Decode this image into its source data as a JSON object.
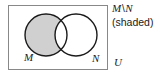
{
  "figure": {
    "kind": "venn-diagram",
    "width": 164,
    "height": 77,
    "background": "#ffffff"
  },
  "diagram": {
    "universe_box": {
      "label": "U",
      "x": 8,
      "y": 5,
      "width": 100,
      "height": 65,
      "stroke": "#888888",
      "stroke_width": 1,
      "fill": "#ffffff"
    },
    "circles": [
      {
        "name": "M",
        "label": "M",
        "cx": 46,
        "cy": 35,
        "r": 21,
        "stroke": "#1a1a1a",
        "stroke_width": 1.4,
        "label_x": 24,
        "label_y": 61
      },
      {
        "name": "N",
        "label": "N",
        "cx": 76,
        "cy": 35,
        "r": 21,
        "stroke": "#1a1a1a",
        "stroke_width": 1.4,
        "label_x": 92,
        "label_y": 62
      }
    ],
    "shaded_region": {
      "name": "M-minus-N",
      "description": "M \\ N",
      "fill": "#d0d0d0",
      "state": "shaded"
    },
    "unshaded_regions": [
      {
        "name": "M-intersect-N",
        "fill": "#ffffff"
      },
      {
        "name": "N-minus-M",
        "fill": "#ffffff"
      }
    ]
  },
  "caption": {
    "set_left": "M",
    "operator": "\\",
    "set_right": "N",
    "note": "(shaded)"
  },
  "labels": {
    "universe": "U",
    "set_m": "M",
    "set_n": "N"
  },
  "colors": {
    "shade": "#d0d0d0",
    "circle_stroke": "#1a1a1a",
    "box_stroke": "#888888",
    "text": "#1a1a1a",
    "background": "#ffffff"
  }
}
